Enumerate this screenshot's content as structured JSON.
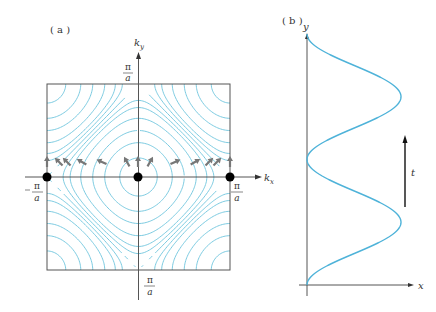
{
  "panel_a": {
    "label": "( a )",
    "axis_x_label": "k",
    "axis_x_sub": "x",
    "axis_y_label": "k",
    "axis_y_sub": "y",
    "tick_top": {
      "num": "π",
      "den": "a"
    },
    "tick_bottom": {
      "num": "π",
      "den": "a"
    },
    "tick_left": {
      "sign": "−",
      "num": "π",
      "den": "a"
    },
    "tick_right": {
      "num": "π",
      "den": "a"
    },
    "contour_levels": [
      -1.8,
      -1.4,
      -1.0,
      -0.6,
      -0.3,
      -0.15,
      0,
      0.15,
      0.3,
      0.6,
      1.0,
      1.4,
      1.8
    ],
    "contour_color": "#6cc4dc",
    "frame_color": "#555555",
    "dot_color": "#000000",
    "arrow_color": "#777777",
    "arrows": [
      {
        "x": 47,
        "angle": 0
      },
      {
        "x": 59,
        "angle": -45
      },
      {
        "x": 67,
        "angle": -45
      },
      {
        "x": 82,
        "angle": -60
      },
      {
        "x": 102,
        "angle": -65
      },
      {
        "x": 127,
        "angle": -30
      },
      {
        "x": 138,
        "angle": 0
      },
      {
        "x": 150,
        "angle": 30
      },
      {
        "x": 175,
        "angle": 65
      },
      {
        "x": 195,
        "angle": 60
      },
      {
        "x": 209,
        "angle": 45
      },
      {
        "x": 217,
        "angle": 45
      },
      {
        "x": 230,
        "angle": 0
      }
    ],
    "dots": [
      {
        "x": 47,
        "y": 177
      },
      {
        "x": 138,
        "y": 177
      },
      {
        "x": 230,
        "y": 177
      }
    ]
  },
  "panel_b": {
    "label": "( b )",
    "axis_x_label": "x",
    "axis_y_label": "y",
    "time_label": "t",
    "curve_color": "#4fb3d9",
    "axis_color": "#555555"
  }
}
